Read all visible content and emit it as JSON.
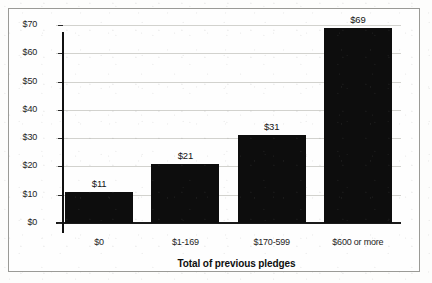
{
  "chart_data": {
    "type": "bar",
    "title": "",
    "subtitle": "",
    "xlabel": "Total of previous pledges",
    "ylabel": "",
    "categories": [
      "$0",
      "$1-169",
      "$170-599",
      "$600 or more"
    ],
    "values": [
      11,
      21,
      31,
      69
    ],
    "data_labels": [
      "$11",
      "$21",
      "$31",
      "$69"
    ],
    "ylim": [
      0,
      70
    ],
    "yticks": [
      0,
      10,
      20,
      30,
      40,
      50,
      60,
      70
    ],
    "ytick_labels": [
      "$0",
      "$10",
      "$20",
      "$30",
      "$40",
      "$50",
      "$60",
      "$70"
    ],
    "grid": true,
    "grid_axis": "y",
    "legend": false,
    "legend_position": "none",
    "bar_color": "#0d0d0d",
    "gridline_color": "#d2d2ce",
    "axis_color": "#101010",
    "background_color": "#fefefe",
    "border_color": "#9a9a96"
  }
}
